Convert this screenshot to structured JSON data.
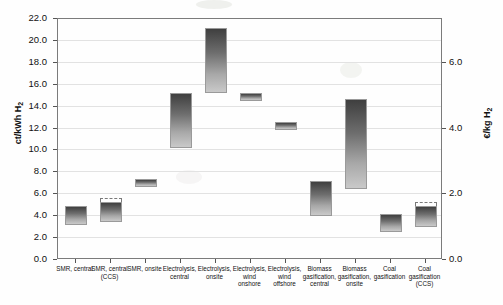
{
  "axes": {
    "y_left_label": "ct/kWh H",
    "y_left_sub": "2",
    "y_right_label": "€/kg H",
    "y_right_sub": "2",
    "y_left_ticks": [
      "22.0",
      "20.0",
      "18.0",
      "16.0",
      "14.0",
      "12.0",
      "10.0",
      "8.0",
      "6.0",
      "4.0",
      "2.0",
      "0.0"
    ],
    "y_right_ticks": [
      "6.0",
      "4.0",
      "2.0",
      "0.0"
    ]
  },
  "chart_data": {
    "type": "bar",
    "title": "",
    "subtitle": "",
    "xlabel": "",
    "ylabel": "ct/kWh H2",
    "ylabel_secondary": "€/kg H2",
    "ylim": [
      0.0,
      22.0
    ],
    "ylim_secondary": [
      0.0,
      7.33
    ],
    "y_ticks": [
      0.0,
      2.0,
      4.0,
      6.0,
      8.0,
      10.0,
      12.0,
      14.0,
      16.0,
      18.0,
      20.0,
      22.0
    ],
    "y_ticks_secondary": [
      0.0,
      2.0,
      4.0,
      6.0
    ],
    "grid": true,
    "legend": "none",
    "note": "Floating range bars (low–high cost spans). Dashed cap = uncertainty extension above bar top.",
    "categories": [
      "SMR, central",
      "SMR, central (CCS)",
      "SMR, onsite",
      "Electrolysis, central",
      "Electrolysis, onsite",
      "Electrolysis, wind onshore",
      "Electrolysis, wind offshore",
      "Biomass gasification, central",
      "Biomass gasification, onsite",
      "Coal gasification",
      "Coal gasification (CCS)"
    ],
    "bars": [
      {
        "label": "SMR, central",
        "low": 3.2,
        "high": 4.9,
        "dashed_high": null
      },
      {
        "label": "SMR, central (CCS)",
        "low": 3.5,
        "high": 5.3,
        "dashed_high": 5.7
      },
      {
        "label": "SMR, onsite",
        "low": 6.7,
        "high": 7.4,
        "dashed_high": null
      },
      {
        "label": "Electrolysis, central",
        "low": 10.2,
        "high": 15.2,
        "dashed_high": null
      },
      {
        "label": "Electrolysis, onsite",
        "low": 15.2,
        "high": 21.2,
        "dashed_high": null
      },
      {
        "label": "Electrolysis, wind onshore",
        "low": 14.5,
        "high": 15.2,
        "dashed_high": null
      },
      {
        "label": "Electrolysis, wind offshore",
        "low": 11.9,
        "high": 12.6,
        "dashed_high": null
      },
      {
        "label": "Biomass gasification, central",
        "low": 4.0,
        "high": 7.2,
        "dashed_high": null
      },
      {
        "label": "Biomass gasification, onsite",
        "low": 6.5,
        "high": 14.7,
        "dashed_high": null
      },
      {
        "label": "Coal gasification",
        "low": 2.6,
        "high": 4.2,
        "dashed_high": null
      },
      {
        "label": "Coal gasification (CCS)",
        "low": 3.0,
        "high": 4.9,
        "dashed_high": 5.3
      }
    ]
  },
  "xlabels": [
    {
      "l1": "SMR, central",
      "l2": "",
      "l3": ""
    },
    {
      "l1": "SMR, central",
      "l2": "(CCS)",
      "l3": ""
    },
    {
      "l1": "SMR, onsite",
      "l2": "",
      "l3": ""
    },
    {
      "l1": "Electrolysis,",
      "l2": "central",
      "l3": ""
    },
    {
      "l1": "Electrolysis,",
      "l2": "onsite",
      "l3": ""
    },
    {
      "l1": "Electrolysis,",
      "l2": "wind",
      "l3": "onshore"
    },
    {
      "l1": "Electrolysis,",
      "l2": "wind",
      "l3": "offshore"
    },
    {
      "l1": "Biomass",
      "l2": "gasification,",
      "l3": "central"
    },
    {
      "l1": "Biomass",
      "l2": "gasification,",
      "l3": "onsite"
    },
    {
      "l1": "Coal",
      "l2": "gasification",
      "l3": ""
    },
    {
      "l1": "Coal",
      "l2": "gasification",
      "l3": "(CCS)"
    }
  ],
  "colors": {
    "bar_top": "#3f3f3f",
    "bar_bottom": "#c9c9c9",
    "bar_border": "#9a9a9a",
    "grid": "#e2e2e2",
    "frame": "#7b7b7b",
    "text": "#111111",
    "background": "#fefefe"
  }
}
